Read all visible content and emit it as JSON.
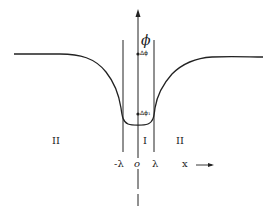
{
  "diagram": {
    "axis": {
      "vertical_label": "ϕ",
      "horizontal_label": "x",
      "origin_label": "o"
    },
    "markers": {
      "delta_phi": "Δϕ",
      "delta_phi_1": "Δϕ₁"
    },
    "boundaries": {
      "left": "-λ",
      "right": "λ"
    },
    "regions": {
      "left": "II",
      "center": "I",
      "right": "II"
    },
    "colors": {
      "line": "#222222",
      "background": "#ffffff"
    }
  }
}
